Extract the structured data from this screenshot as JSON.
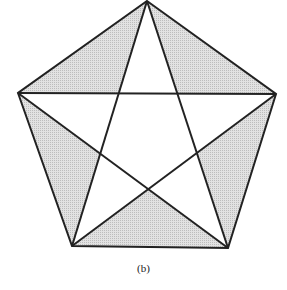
{
  "figure": {
    "caption": "(b)",
    "colors": {
      "stroke": "#222222",
      "shade": "#d4d4d4",
      "background": "#ffffff"
    },
    "vertices": {
      "top": [
        147,
        1
      ],
      "left": [
        18,
        93
      ],
      "right": [
        276,
        94
      ],
      "bottom_left": [
        72,
        246
      ],
      "bottom_right": [
        228,
        248
      ]
    },
    "inner_points": {
      "upper_left": [
        119,
        93.5
      ],
      "upper_right": [
        177,
        93.5
      ],
      "lower_left": [
        100,
        154
      ],
      "lower_right": [
        198,
        153
      ],
      "bottom": [
        148,
        189
      ]
    },
    "shaded_triangles": [
      "top-left",
      "top-right",
      "left",
      "right",
      "bottom"
    ]
  }
}
